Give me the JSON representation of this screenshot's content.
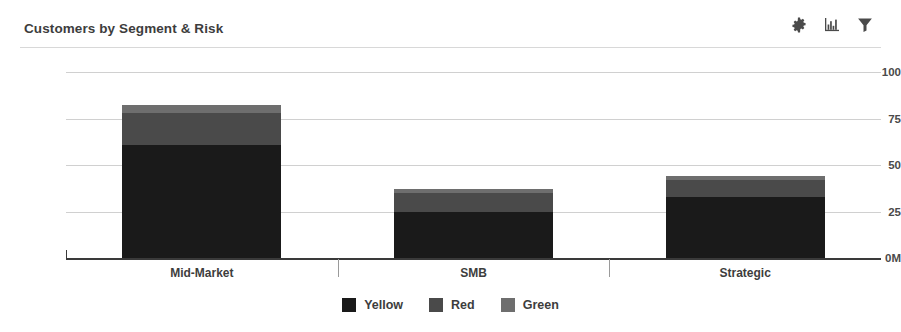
{
  "header": {
    "title": "Customers by Segment & Risk",
    "tools": [
      {
        "name": "gear-icon",
        "label": "Settings"
      },
      {
        "name": "bar-chart-icon",
        "label": "Chart type"
      },
      {
        "name": "filter-icon",
        "label": "Filter"
      }
    ]
  },
  "chart_data": {
    "type": "bar",
    "stacked": true,
    "title": "Customers by Segment & Risk",
    "xlabel": "",
    "ylabel": "",
    "categories": [
      "Mid-Market",
      "SMB",
      "Strategic"
    ],
    "series": [
      {
        "name": "Yellow",
        "color": "#1a1a1a",
        "values": [
          61,
          25,
          33
        ]
      },
      {
        "name": "Red",
        "color": "#4a4a4a",
        "values": [
          17,
          10,
          9
        ]
      },
      {
        "name": "Green",
        "color": "#6e6e6e",
        "values": [
          4,
          2,
          2
        ]
      }
    ],
    "totals": [
      82,
      37,
      44
    ],
    "ylim": [
      0,
      100
    ],
    "yticks": [
      0,
      25,
      50,
      75,
      100
    ],
    "ytick_labels": [
      "0M",
      "25",
      "50",
      "75",
      "100"
    ],
    "grid": true,
    "legend_position": "bottom",
    "legend_entries": [
      "Yellow",
      "Red",
      "Green"
    ]
  },
  "colors": {
    "grid": "#d0d0d0",
    "axis": "#3a3a3a",
    "text": "#3d3d3d",
    "rule": "#d8d8d8"
  }
}
